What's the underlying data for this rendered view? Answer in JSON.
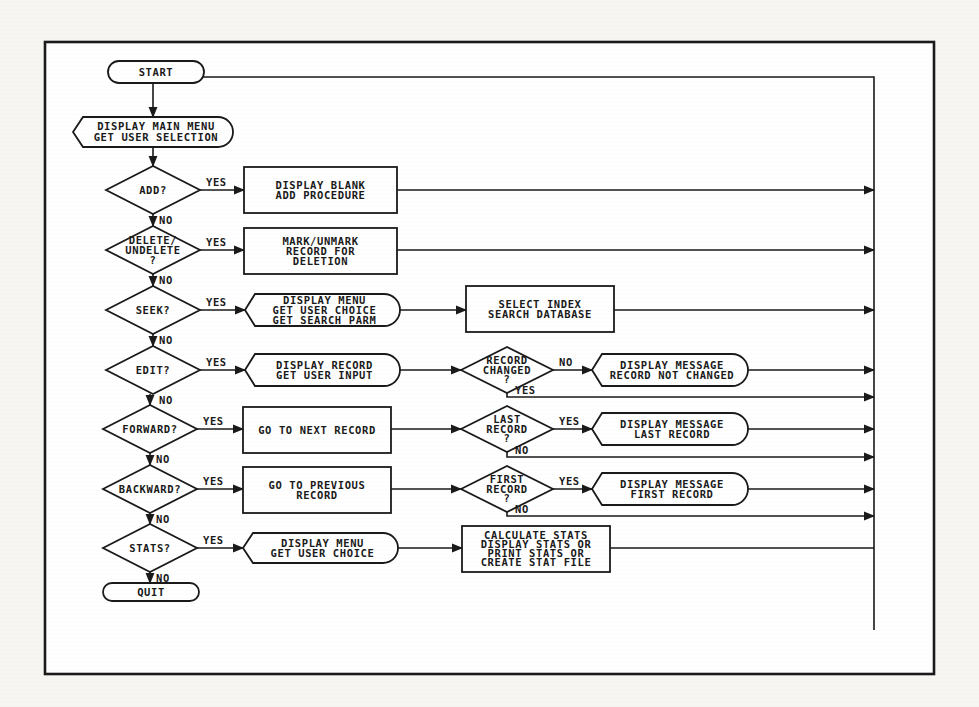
{
  "diagram": {
    "colors": {
      "ink": "#1a1a1a",
      "paper": "#ffffff",
      "background": "#f7f6f3"
    },
    "frame": {
      "x": 45,
      "y": 42,
      "w": 889,
      "h": 632
    },
    "return_bus_x": 874,
    "loop_top_y": 77,
    "terminals": [
      {
        "id": "start",
        "label": "START",
        "x": 108,
        "y": 61,
        "w": 96,
        "h": 22
      },
      {
        "id": "quit",
        "label": "QUIT",
        "x": 103,
        "y": 583,
        "w": 96,
        "h": 18
      }
    ],
    "main_menu": {
      "id": "display-main-menu",
      "lines": [
        "DISPLAY MAIN MENU",
        "GET USER SELECTION"
      ],
      "x": 73,
      "y": 117,
      "w": 160,
      "h": 30
    },
    "decisions": [
      {
        "id": "add",
        "lines": [
          "ADD?"
        ],
        "cx": 153,
        "cy": 190,
        "hw": 47,
        "hh": 24,
        "yes": "YES",
        "no": "NO"
      },
      {
        "id": "delete",
        "lines": [
          "DELETE/",
          "UNDELETE",
          "?"
        ],
        "cx": 153,
        "cy": 250,
        "hw": 47,
        "hh": 24,
        "yes": "YES",
        "no": "NO"
      },
      {
        "id": "seek",
        "lines": [
          "SEEK?"
        ],
        "cx": 153,
        "cy": 310,
        "hw": 47,
        "hh": 24,
        "yes": "YES",
        "no": "NO"
      },
      {
        "id": "edit",
        "lines": [
          "EDIT?"
        ],
        "cx": 153,
        "cy": 370,
        "hw": 47,
        "hh": 24,
        "yes": "YES",
        "no": "NO"
      },
      {
        "id": "forward",
        "lines": [
          "FORWARD?"
        ],
        "cx": 150,
        "cy": 429,
        "hw": 47,
        "hh": 24,
        "yes": "YES",
        "no": "NO"
      },
      {
        "id": "backward",
        "lines": [
          "BACKWARD?"
        ],
        "cx": 150,
        "cy": 489,
        "hw": 47,
        "hh": 24,
        "yes": "YES",
        "no": "NO"
      },
      {
        "id": "stats",
        "lines": [
          "STATS?"
        ],
        "cx": 150,
        "cy": 548,
        "hw": 47,
        "hh": 24,
        "yes": "YES",
        "no": "NO"
      }
    ],
    "actions": [
      {
        "id": "display-blank",
        "shape": "rect",
        "lines": [
          "DISPLAY BLANK",
          "ADD PROCEDURE"
        ],
        "x": 244,
        "y": 167,
        "w": 153,
        "h": 46,
        "row_y": 190
      },
      {
        "id": "mark-unmark",
        "shape": "rect",
        "lines": [
          "MARK/UNMARK",
          "RECORD FOR",
          "DELETION"
        ],
        "x": 244,
        "y": 228,
        "w": 153,
        "h": 46,
        "row_y": 250
      },
      {
        "id": "seek-menu",
        "shape": "display",
        "lines": [
          "DISPLAY MENU",
          "GET USER CHOICE",
          "GET SEARCH PARM"
        ],
        "x": 245,
        "y": 294,
        "w": 155,
        "h": 32,
        "row_y": 310
      },
      {
        "id": "select-index",
        "shape": "rect",
        "lines": [
          "SELECT INDEX",
          "SEARCH DATABASE"
        ],
        "x": 466,
        "y": 286,
        "w": 148,
        "h": 46,
        "row_y": 310
      },
      {
        "id": "display-record",
        "shape": "display",
        "lines": [
          "DISPLAY RECORD",
          "GET USER INPUT"
        ],
        "x": 245,
        "y": 354,
        "w": 155,
        "h": 32,
        "row_y": 370
      },
      {
        "id": "next-record",
        "shape": "rect",
        "lines": [
          "GO TO NEXT RECORD"
        ],
        "x": 243,
        "y": 407,
        "w": 148,
        "h": 46,
        "row_y": 429
      },
      {
        "id": "prev-record",
        "shape": "rect",
        "lines": [
          "GO TO PREVIOUS",
          "RECORD"
        ],
        "x": 243,
        "y": 467,
        "w": 148,
        "h": 46,
        "row_y": 489
      },
      {
        "id": "stats-menu",
        "shape": "display",
        "lines": [
          "DISPLAY MENU",
          "GET USER CHOICE"
        ],
        "x": 243,
        "y": 533,
        "w": 155,
        "h": 30,
        "row_y": 548
      },
      {
        "id": "calc-stats",
        "shape": "rect",
        "lines": [
          "CALCULATE STATS",
          "DISPLAY STATS OR",
          "PRINT STATS OR",
          "CREATE STAT FILE"
        ],
        "x": 462,
        "y": 526,
        "w": 148,
        "h": 46,
        "row_y": 548
      }
    ],
    "sub_decisions": [
      {
        "id": "record-changed",
        "lines": [
          "RECORD",
          "CHANGED",
          "?"
        ],
        "cx": 507,
        "cy": 370,
        "hw": 46,
        "hh": 23,
        "right": "NO",
        "bottom": "YES",
        "bottom_y": 397
      },
      {
        "id": "last-record",
        "lines": [
          "LAST",
          "RECORD",
          "?"
        ],
        "cx": 507,
        "cy": 429,
        "hw": 46,
        "hh": 23,
        "right": "YES",
        "bottom": "NO",
        "bottom_y": 457
      },
      {
        "id": "first-record",
        "lines": [
          "FIRST",
          "RECORD",
          "?"
        ],
        "cx": 507,
        "cy": 489,
        "hw": 46,
        "hh": 23,
        "right": "YES",
        "bottom": "NO",
        "bottom_y": 516
      }
    ],
    "messages": [
      {
        "id": "msg-not-changed",
        "lines": [
          "DISPLAY MESSAGE",
          "RECORD NOT CHANGED"
        ],
        "x": 592,
        "y": 354,
        "w": 156,
        "h": 32,
        "row_y": 370
      },
      {
        "id": "msg-last",
        "lines": [
          "DISPLAY MESSAGE",
          "LAST RECORD"
        ],
        "x": 592,
        "y": 413,
        "w": 156,
        "h": 32,
        "row_y": 429
      },
      {
        "id": "msg-first",
        "lines": [
          "DISPLAY MESSAGE",
          "FIRST RECORD"
        ],
        "x": 592,
        "y": 473,
        "w": 156,
        "h": 32,
        "row_y": 489
      }
    ]
  }
}
